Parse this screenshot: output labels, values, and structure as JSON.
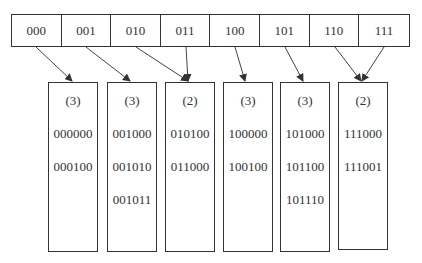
{
  "directory": {
    "entries": [
      "000",
      "001",
      "010",
      "011",
      "100",
      "101",
      "110",
      "111"
    ]
  },
  "buckets": [
    {
      "depth": "(3)",
      "keys": [
        "000000",
        "000100"
      ]
    },
    {
      "depth": "(3)",
      "keys": [
        "001000",
        "001010",
        "001011"
      ]
    },
    {
      "depth": "(2)",
      "keys": [
        "010100",
        "011000"
      ]
    },
    {
      "depth": "(3)",
      "keys": [
        "100000",
        "100100"
      ]
    },
    {
      "depth": "(3)",
      "keys": [
        "101000",
        "101100",
        "101110"
      ]
    },
    {
      "depth": "(2)",
      "keys": [
        "111000",
        "111001"
      ]
    }
  ],
  "pointers": [
    {
      "from": "000",
      "to_bucket": 0
    },
    {
      "from": "001",
      "to_bucket": 1
    },
    {
      "from": "010",
      "to_bucket": 2
    },
    {
      "from": "011",
      "to_bucket": 2
    },
    {
      "from": "100",
      "to_bucket": 3
    },
    {
      "from": "101",
      "to_bucket": 4
    },
    {
      "from": "110",
      "to_bucket": 5
    },
    {
      "from": "111",
      "to_bucket": 5
    }
  ]
}
